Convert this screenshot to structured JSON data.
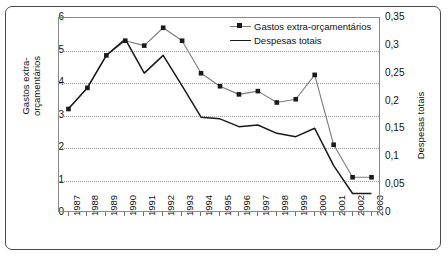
{
  "chart_data": {
    "type": "line",
    "title": "",
    "xlabel": "",
    "ylabel": "Gastos extra-orçamentários",
    "y2label": "Despesas totais",
    "categories": [
      "1987",
      "1988",
      "1989",
      "1990",
      "1991",
      "1992",
      "1993",
      "1994",
      "1995",
      "1996",
      "1997",
      "1998",
      "1999",
      "2000",
      "2001",
      "2002",
      "2003"
    ],
    "ylim": [
      0,
      6
    ],
    "yticks": [
      "0",
      "1",
      "2",
      "3",
      "4",
      "5",
      "6"
    ],
    "y2lim": [
      0,
      0.35
    ],
    "y2ticks": [
      "0",
      "0,05",
      "0,1",
      "0,15",
      "0,2",
      "0,25",
      "0,3",
      "0,35"
    ],
    "grid": "horizontal-dotted",
    "legend_position": "top-right",
    "series": [
      {
        "name": "Gastos extra-orçamentários",
        "axis": "left",
        "color": "#7d7d7d",
        "marker": "square",
        "marker_color": "#1a1a1a",
        "values": [
          3.2,
          3.85,
          4.85,
          5.3,
          5.15,
          5.7,
          5.3,
          4.3,
          3.9,
          3.65,
          3.75,
          3.4,
          3.5,
          4.25,
          2.1,
          1.1,
          1.1
        ]
      },
      {
        "name": "Despesas totais",
        "axis": "right",
        "color": "#1a1a1a",
        "marker": "none",
        "values": [
          0.187,
          0.225,
          0.283,
          0.312,
          0.251,
          0.283,
          0.228,
          0.172,
          0.169,
          0.155,
          0.158,
          0.143,
          0.137,
          0.152,
          0.085,
          0.035,
          0.035
        ]
      }
    ]
  },
  "legend": {
    "items": [
      {
        "label": "Gastos extra-orçamentários",
        "key": "line-with-square-marker"
      },
      {
        "label": "Despesas totais",
        "key": "plain-line"
      }
    ]
  }
}
